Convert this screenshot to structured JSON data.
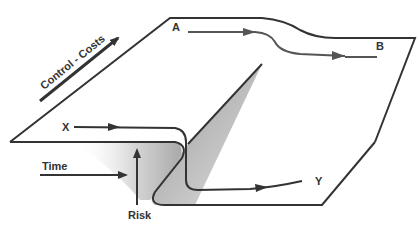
{
  "diagram": {
    "labels": {
      "control_costs": "Control - Costs",
      "a": "A",
      "b": "B",
      "x": "X",
      "y": "Y",
      "time": "Time",
      "risk": "Risk"
    },
    "colors": {
      "line": "#333333",
      "upper_path": "#555555",
      "shadow_dark": "#8a8a8a",
      "shadow_light": "#e6e6e6",
      "background": "#ffffff"
    }
  }
}
